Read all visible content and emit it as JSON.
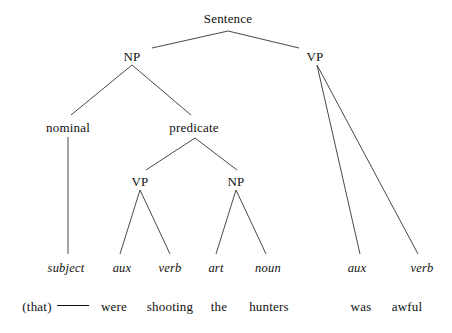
{
  "figure": {
    "type": "syntax-tree",
    "background_color": "#ffffff",
    "line_color": "#333333",
    "text_color": "#111111",
    "width": 452,
    "height": 333
  },
  "nodes": {
    "root": {
      "label": "Sentence",
      "x": 228,
      "y": 12
    },
    "np_subject": {
      "label": "NP",
      "x": 132,
      "y": 50
    },
    "vp_main": {
      "label": "VP",
      "x": 315,
      "y": 50
    },
    "nominal": {
      "label": "nominal",
      "x": 68,
      "y": 121
    },
    "predicate": {
      "label": "predicate",
      "x": 194,
      "y": 121
    },
    "vp_inner": {
      "label": "VP",
      "x": 140,
      "y": 175
    },
    "np_inner": {
      "label": "NP",
      "x": 236,
      "y": 175
    }
  },
  "terminals": [
    {
      "label": "subject",
      "x": 66,
      "y": 262
    },
    {
      "label": "aux",
      "x": 122,
      "y": 262
    },
    {
      "label": "verb",
      "x": 170,
      "y": 262
    },
    {
      "label": "art",
      "x": 216,
      "y": 262
    },
    {
      "label": "noun",
      "x": 268,
      "y": 262
    },
    {
      "label": "aux",
      "x": 357,
      "y": 262
    },
    {
      "label": "verb",
      "x": 422,
      "y": 262
    }
  ],
  "words": [
    {
      "label": "(that)",
      "x": 37,
      "y": 300
    },
    {
      "label": "were",
      "x": 114,
      "y": 300
    },
    {
      "label": "shooting",
      "x": 170,
      "y": 300
    },
    {
      "label": "the",
      "x": 219,
      "y": 300
    },
    {
      "label": "hunters",
      "x": 269,
      "y": 300
    },
    {
      "label": "was",
      "x": 361,
      "y": 300
    },
    {
      "label": "awful",
      "x": 407,
      "y": 300
    }
  ],
  "blank": {
    "x": 73,
    "y": 305,
    "width": 32
  },
  "edges": [
    {
      "name": "sentence-to-np",
      "x1": 228,
      "y1": 31,
      "x2": 152,
      "y2": 48
    },
    {
      "name": "sentence-to-vp",
      "x1": 228,
      "y1": 31,
      "x2": 299,
      "y2": 48
    },
    {
      "name": "np-to-nominal",
      "x1": 132,
      "y1": 65,
      "x2": 71,
      "y2": 115
    },
    {
      "name": "np-to-predicate",
      "x1": 132,
      "y1": 65,
      "x2": 191,
      "y2": 115
    },
    {
      "name": "nominal-to-subject",
      "x1": 68,
      "y1": 137,
      "x2": 68,
      "y2": 254
    },
    {
      "name": "predicate-to-vp",
      "x1": 195,
      "y1": 138,
      "x2": 146,
      "y2": 170
    },
    {
      "name": "predicate-to-np",
      "x1": 195,
      "y1": 138,
      "x2": 237,
      "y2": 170
    },
    {
      "name": "vp-inner-to-aux",
      "x1": 140,
      "y1": 190,
      "x2": 120,
      "y2": 254
    },
    {
      "name": "vp-inner-to-verb",
      "x1": 140,
      "y1": 190,
      "x2": 170,
      "y2": 254
    },
    {
      "name": "np-inner-to-art",
      "x1": 236,
      "y1": 190,
      "x2": 216,
      "y2": 254
    },
    {
      "name": "np-inner-to-noun",
      "x1": 236,
      "y1": 190,
      "x2": 266,
      "y2": 254
    },
    {
      "name": "vp-main-to-aux",
      "x1": 317,
      "y1": 65,
      "x2": 360,
      "y2": 254
    },
    {
      "name": "vp-main-to-verb",
      "x1": 317,
      "y1": 65,
      "x2": 418,
      "y2": 254
    }
  ]
}
